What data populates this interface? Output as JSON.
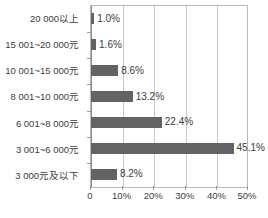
{
  "chart_data": {
    "type": "bar",
    "orientation": "horizontal",
    "title": "",
    "subtitle": "",
    "xlabel": "",
    "ylabel": "",
    "categories": [
      "20 000以上",
      "15 001~20 000元",
      "10 001~15 000元",
      "8 001~10 000元",
      "6 001~8 000元",
      "3 001~6 000元",
      "3 000元及以下"
    ],
    "values": [
      1.0,
      1.6,
      8.6,
      13.2,
      22.4,
      45.1,
      8.2
    ],
    "data_labels": [
      "1.0%",
      "1.6%",
      "8.6%",
      "13.2%",
      "22.4%",
      "45.1%",
      "8.2%"
    ],
    "xlim": [
      0,
      50
    ],
    "xticks": [
      0,
      10,
      20,
      30,
      40,
      50
    ],
    "xtick_labels": [
      "0",
      "10%",
      "20%",
      "30%",
      "40%",
      "50%"
    ],
    "grid": "vertical",
    "legend": "none",
    "series": [
      {
        "name": "",
        "values": [
          1.0,
          1.6,
          8.6,
          13.2,
          22.4,
          45.1,
          8.2
        ]
      }
    ],
    "colors": {
      "bar": "#636363",
      "grid": "#c8c8c8",
      "frame": "#b9b9b9",
      "axis": "#8c8c8c",
      "text": "#3c3c3c",
      "background": "#ffffff"
    }
  }
}
